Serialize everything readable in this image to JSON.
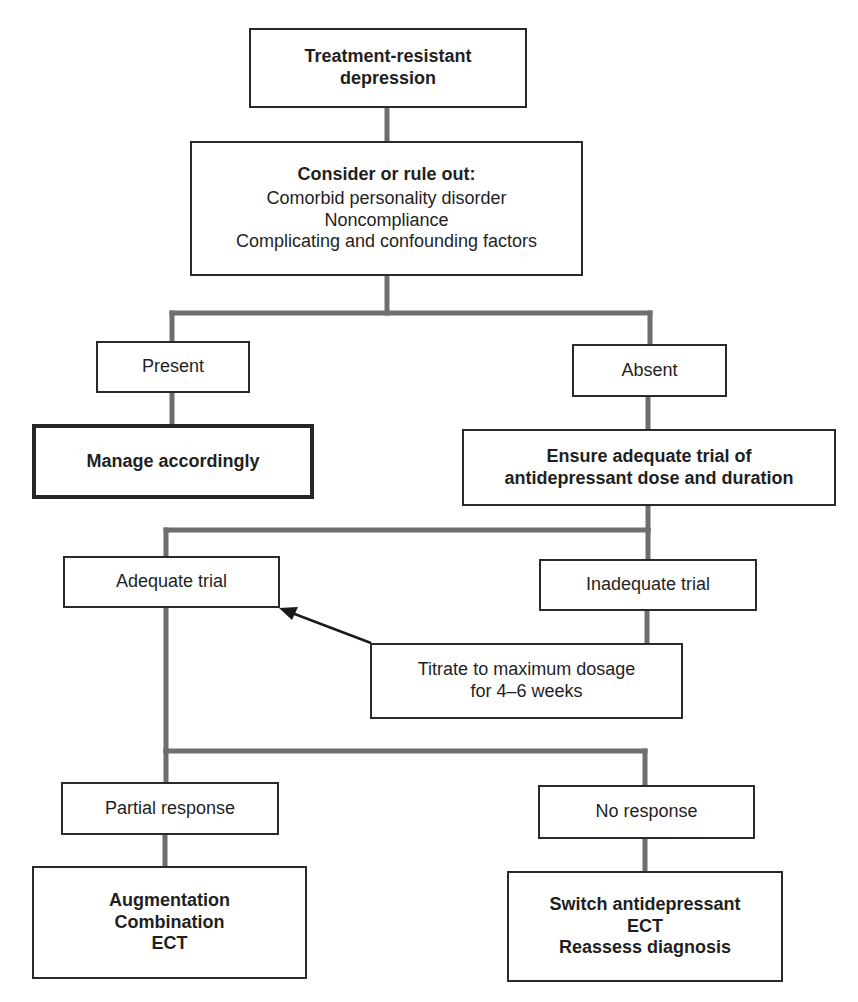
{
  "diagram": {
    "type": "flowchart",
    "colors": {
      "connector": "#6e6e6e",
      "border": "#2a2a2a",
      "arrow": "#1a1a1a"
    },
    "nodes": {
      "root": {
        "lines": [
          "Treatment-resistant",
          "depression"
        ]
      },
      "consider": {
        "heading": "Consider or rule out:",
        "items": [
          "Comorbid personality disorder",
          "Noncompliance",
          "Complicating and confounding factors"
        ]
      },
      "present": {
        "label": "Present"
      },
      "absent": {
        "label": "Absent"
      },
      "manage": {
        "label": "Manage accordingly"
      },
      "ensure": {
        "lines": [
          "Ensure adequate trial of",
          "antidepressant dose and duration"
        ]
      },
      "adequate": {
        "label": "Adequate trial"
      },
      "inadequate": {
        "label": "Inadequate trial"
      },
      "titrate": {
        "lines": [
          "Titrate to maximum dosage",
          "for 4–6 weeks"
        ]
      },
      "partial": {
        "label": "Partial response"
      },
      "noresponse": {
        "label": "No response"
      },
      "partial_actions": {
        "lines": [
          "Augmentation",
          "Combination",
          "ECT"
        ]
      },
      "noresponse_actions": {
        "lines": [
          "Switch antidepressant",
          "ECT",
          "Reassess diagnosis"
        ]
      }
    },
    "edges": [
      [
        "root",
        "consider"
      ],
      [
        "consider",
        "present"
      ],
      [
        "consider",
        "absent"
      ],
      [
        "present",
        "manage"
      ],
      [
        "absent",
        "ensure"
      ],
      [
        "ensure",
        "adequate"
      ],
      [
        "ensure",
        "inadequate"
      ],
      [
        "inadequate",
        "titrate"
      ],
      [
        "titrate",
        "adequate",
        "arrow"
      ],
      [
        "adequate",
        "partial"
      ],
      [
        "adequate",
        "noresponse"
      ],
      [
        "partial",
        "partial_actions"
      ],
      [
        "noresponse",
        "noresponse_actions"
      ]
    ]
  }
}
